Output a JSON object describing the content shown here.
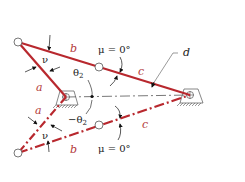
{
  "diagram": {
    "colors": {
      "link": "#b8282e",
      "ground": "#555555",
      "annotation": "#111111"
    },
    "top_configuration": {
      "labels": {
        "link_a": "a",
        "link_b": "b",
        "link_c": "c",
        "ground_d": "d",
        "nu": "ν",
        "theta": "θ",
        "theta_sub": "2",
        "mu": "μ = 0°"
      }
    },
    "bottom_configuration": {
      "labels": {
        "link_a": "a",
        "link_b": "b",
        "link_c": "c",
        "nu": "ν",
        "theta": "−θ",
        "theta_sub": "2",
        "mu": "μ = 0°"
      }
    }
  }
}
